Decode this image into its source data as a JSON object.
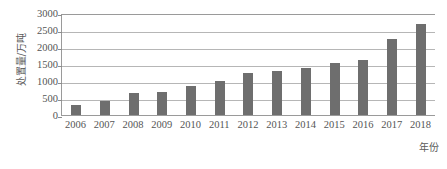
{
  "chart_data": {
    "type": "bar",
    "title": "",
    "xlabel": "年份",
    "ylabel": "处置量/万吨",
    "categories": [
      "2006",
      "2007",
      "2008",
      "2009",
      "2010",
      "2011",
      "2012",
      "2013",
      "2014",
      "2015",
      "2016",
      "2017",
      "2018"
    ],
    "values": [
      300,
      400,
      640,
      690,
      860,
      1000,
      1240,
      1300,
      1390,
      1530,
      1620,
      2230,
      2670
    ],
    "series": [
      {
        "name": "处置量",
        "values": [
          300,
          400,
          640,
          690,
          860,
          1000,
          1240,
          1300,
          1390,
          1530,
          1620,
          2230,
          2670
        ]
      }
    ],
    "ylim": [
      0,
      3000
    ],
    "yticks": [
      0,
      500,
      1000,
      1500,
      2000,
      2500,
      3000
    ],
    "ytick_labels": [
      "0",
      "500",
      "1000",
      "1500",
      "2000",
      "2500",
      "3000"
    ],
    "grid": true,
    "legend": false,
    "legend_position": "none",
    "bar_color": "#6e6e6e",
    "gridline_color": "#9a9a9a",
    "axis_color": "#9a9a9a",
    "text_color": "#555555",
    "background_color": "#ffffff"
  }
}
